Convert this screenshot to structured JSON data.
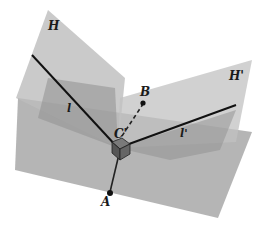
{
  "diagram": {
    "labels": {
      "H": "H",
      "H_prime": "H'",
      "l": "l",
      "l_prime": "l'",
      "B": "B",
      "C_prime": "C'",
      "A": "A"
    },
    "colors": {
      "plane_base": "#a9a9a9",
      "plane_H": "#b8b8b8",
      "plane_H_prime": "#bcbcbc",
      "overlap_dark": "#8e8e8e",
      "lines": "#111111",
      "cube_dark": "#5a5a5a",
      "cube_top": "#7a7a7a"
    },
    "elements": [
      "half-plane H",
      "half-plane H'",
      "base plane",
      "line l in H",
      "line l' in H'",
      "point B",
      "point C'",
      "point A",
      "segment A-C' (solid)",
      "segment C'-B (dashed)",
      "right-angle cube marker at C'"
    ]
  }
}
